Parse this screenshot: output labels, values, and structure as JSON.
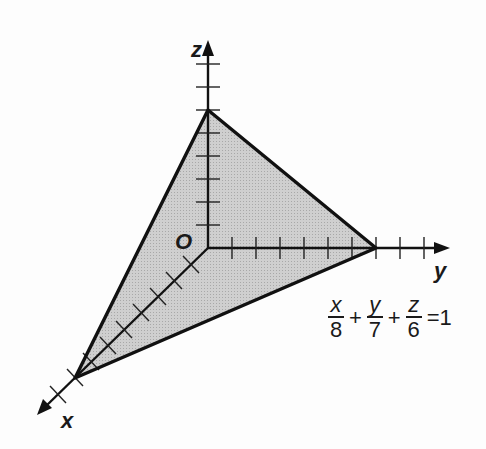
{
  "diagram": {
    "type": "3d-coordinate-plane",
    "axes": {
      "x_label": "x",
      "y_label": "y",
      "z_label": "z",
      "origin_label": "O"
    },
    "intercepts": {
      "x": 8,
      "y": 7,
      "z": 6
    },
    "colors": {
      "fill": "#c9c9c9",
      "stroke": "#111111",
      "background": "#fdfdfd"
    }
  },
  "equation": {
    "terms": [
      {
        "numerator": "x",
        "denominator": "8"
      },
      {
        "numerator": "y",
        "denominator": "7"
      },
      {
        "numerator": "z",
        "denominator": "6"
      }
    ],
    "plus": "+",
    "rhs": "=1"
  }
}
